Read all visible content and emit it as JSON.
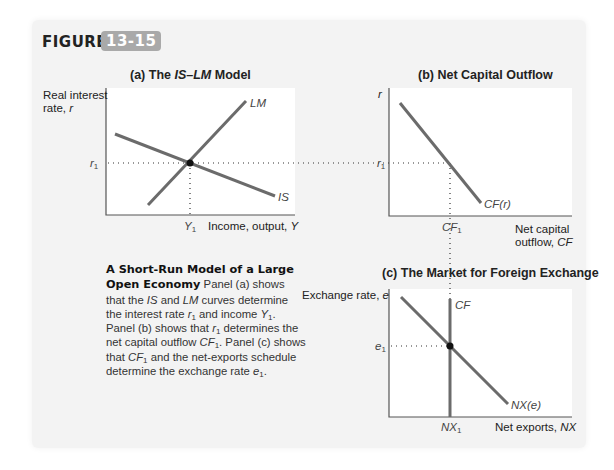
{
  "figure": {
    "label": "FIGURE",
    "number": "13-15",
    "badge_color": "#a9a9a9"
  },
  "panels": {
    "a": {
      "title_prefix": "(a) The ",
      "title_italic": "IS–LM",
      "title_suffix": " Model",
      "y_axis_label_line1": "Real interest",
      "y_axis_label_line2": "rate, ",
      "y_axis_var": "r",
      "x_axis_label": "Income, output, ",
      "x_axis_var": "Y",
      "curve_labels": {
        "lm": "LM",
        "is": "IS"
      },
      "tick_y": "r",
      "tick_y_sub": "1",
      "tick_x": "Y",
      "tick_x_sub": "1"
    },
    "b": {
      "title": "(b) Net Capital Outflow",
      "y_axis_var": "r",
      "x_axis_label_line1": "Net capital",
      "x_axis_label_line2": "outflow, ",
      "x_axis_var": "CF",
      "curve_label": "CF(r)",
      "tick_y": "r",
      "tick_y_sub": "1",
      "tick_x": "CF",
      "tick_x_sub": "1"
    },
    "c": {
      "title": "(c) The Market for Foreign Exchange",
      "y_axis_label": "Exchange rate, ",
      "y_axis_var": "e",
      "x_axis_label": "Net exports, ",
      "x_axis_var": "NX",
      "curve_labels": {
        "cf": "CF",
        "nx": "NX(e)"
      },
      "tick_y": "e",
      "tick_y_sub": "1",
      "tick_x": "NX",
      "tick_x_sub": "1"
    }
  },
  "caption": {
    "heading": "A Short-Run Model of a Large Open Economy",
    "p1": " Panel (a) shows that the ",
    "is": "IS",
    "p2": " and ",
    "lm": "LM",
    "p3": " curves determine the interest rate ",
    "r": "r",
    "p4": " and income ",
    "y": "Y",
    "p5": ". Panel (b) shows that ",
    "p6": " determines the net capital outflow ",
    "cf": "CF",
    "p7": ". Panel (c) shows that ",
    "p8": " and the net-exports schedule determine the exchange rate ",
    "e": "e",
    "p9": ".",
    "sub": "1"
  },
  "colors": {
    "curve": "#6b6b6b",
    "axis": "#555555",
    "background": "#f3f3f3",
    "plot": "#ffffff"
  }
}
